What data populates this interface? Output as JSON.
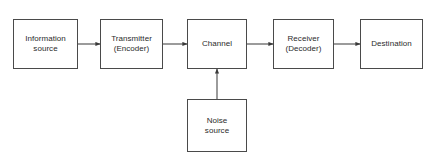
{
  "diagram": {
    "type": "block-flow-diagram",
    "background_color": "#ffffff",
    "line_color": "#4a4a4a",
    "text_color": "#2b2b2b",
    "nodes": [
      {
        "id": "information-source",
        "label": "Information\nsource",
        "x": 13,
        "y": 19,
        "w": 65,
        "h": 50
      },
      {
        "id": "transmitter",
        "label": "Transmitter\n(Encoder)",
        "x": 100,
        "y": 19,
        "w": 63,
        "h": 50
      },
      {
        "id": "channel",
        "label": "Channel",
        "x": 187,
        "y": 19,
        "w": 60,
        "h": 50
      },
      {
        "id": "receiver",
        "label": "Receiver\n(Decoder)",
        "x": 273,
        "y": 19,
        "w": 61,
        "h": 50
      },
      {
        "id": "destination",
        "label": "Destination",
        "x": 360,
        "y": 19,
        "w": 63,
        "h": 50
      },
      {
        "id": "noise-source",
        "label": "Noise\nsource",
        "x": 187,
        "y": 99,
        "w": 60,
        "h": 53
      }
    ],
    "edges": [
      {
        "id": "edge-source-to-transmitter",
        "from": "information-source",
        "to": "transmitter",
        "direction": "right",
        "x1": 78,
        "y1": 44,
        "x2": 100,
        "y2": 44
      },
      {
        "id": "edge-transmitter-to-channel",
        "from": "transmitter",
        "to": "channel",
        "direction": "right",
        "x1": 163,
        "y1": 44,
        "x2": 187,
        "y2": 44
      },
      {
        "id": "edge-channel-to-receiver",
        "from": "channel",
        "to": "receiver",
        "direction": "right",
        "x1": 247,
        "y1": 44,
        "x2": 273,
        "y2": 44
      },
      {
        "id": "edge-receiver-to-destination",
        "from": "receiver",
        "to": "destination",
        "direction": "right",
        "x1": 334,
        "y1": 44,
        "x2": 360,
        "y2": 44
      },
      {
        "id": "edge-noise-to-channel",
        "from": "noise-source",
        "to": "channel",
        "direction": "up",
        "x1": 217,
        "y1": 99,
        "x2": 217,
        "y2": 69
      }
    ]
  }
}
